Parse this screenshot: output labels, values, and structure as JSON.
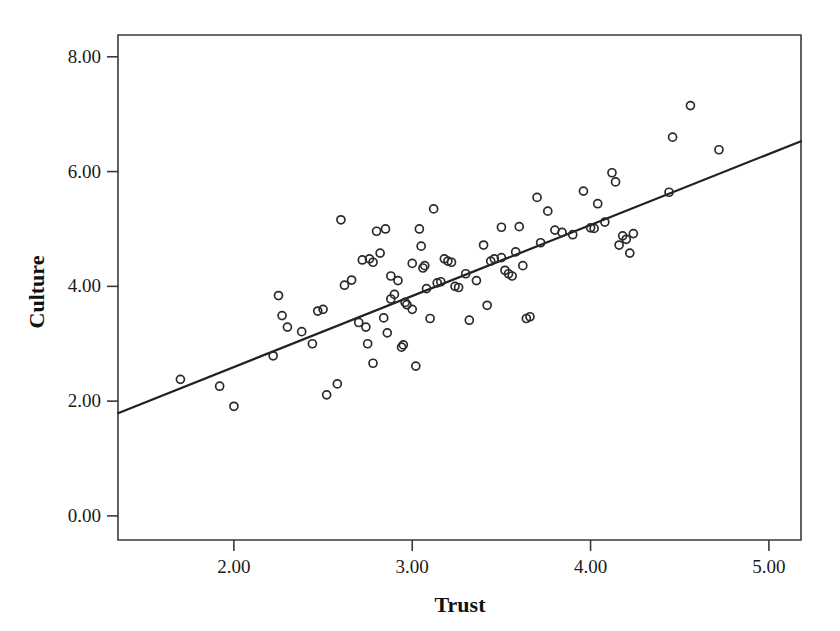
{
  "chart_data": {
    "type": "scatter",
    "title": "",
    "xlabel": "Trust",
    "ylabel": "Culture",
    "xlim": [
      1.35,
      5.18
    ],
    "ylim": [
      -0.42,
      8.38
    ],
    "xticks": [
      2.0,
      3.0,
      4.0,
      5.0
    ],
    "xtick_labels": [
      "2.00",
      "3.00",
      "4.00",
      "5.00"
    ],
    "yticks": [
      0.0,
      2.0,
      4.0,
      6.0,
      8.0
    ],
    "ytick_labels": [
      "0.00",
      "2.00",
      "4.00",
      "6.00",
      "8.00"
    ],
    "grid": false,
    "legend": null,
    "marker": "open-circle",
    "marker_color": "#2a2a2a",
    "fit_line": {
      "type": "linear-regression",
      "color": "#222222",
      "x_start": 1.35,
      "y_start": 1.79,
      "x_end": 5.18,
      "y_end": 6.53,
      "slope": 1.238,
      "intercept": 0.118
    },
    "points": [
      [
        1.7,
        2.38
      ],
      [
        1.92,
        2.26
      ],
      [
        2.0,
        1.91
      ],
      [
        2.22,
        2.79
      ],
      [
        2.25,
        3.84
      ],
      [
        2.27,
        3.49
      ],
      [
        2.3,
        3.29
      ],
      [
        2.38,
        3.21
      ],
      [
        2.44,
        3.0
      ],
      [
        2.47,
        3.57
      ],
      [
        2.5,
        3.6
      ],
      [
        2.52,
        2.11
      ],
      [
        2.58,
        2.3
      ],
      [
        2.6,
        5.16
      ],
      [
        2.62,
        4.02
      ],
      [
        2.66,
        4.11
      ],
      [
        2.7,
        3.37
      ],
      [
        2.72,
        4.46
      ],
      [
        2.74,
        3.29
      ],
      [
        2.75,
        3.0
      ],
      [
        2.76,
        4.48
      ],
      [
        2.78,
        4.42
      ],
      [
        2.78,
        2.66
      ],
      [
        2.8,
        4.96
      ],
      [
        2.82,
        4.58
      ],
      [
        2.84,
        3.45
      ],
      [
        2.85,
        5.0
      ],
      [
        2.86,
        3.19
      ],
      [
        2.88,
        4.18
      ],
      [
        2.88,
        3.78
      ],
      [
        2.9,
        3.86
      ],
      [
        2.92,
        4.1
      ],
      [
        2.94,
        2.94
      ],
      [
        2.95,
        2.98
      ],
      [
        2.96,
        3.72
      ],
      [
        2.97,
        3.68
      ],
      [
        3.0,
        4.4
      ],
      [
        3.0,
        3.6
      ],
      [
        3.02,
        2.61
      ],
      [
        3.04,
        5.0
      ],
      [
        3.05,
        4.7
      ],
      [
        3.06,
        4.32
      ],
      [
        3.07,
        4.36
      ],
      [
        3.08,
        3.96
      ],
      [
        3.1,
        3.44
      ],
      [
        3.12,
        5.35
      ],
      [
        3.14,
        4.06
      ],
      [
        3.16,
        4.08
      ],
      [
        3.18,
        4.48
      ],
      [
        3.2,
        4.44
      ],
      [
        3.22,
        4.42
      ],
      [
        3.24,
        4.0
      ],
      [
        3.26,
        3.98
      ],
      [
        3.3,
        4.22
      ],
      [
        3.32,
        3.41
      ],
      [
        3.36,
        4.1
      ],
      [
        3.4,
        4.72
      ],
      [
        3.42,
        3.67
      ],
      [
        3.44,
        4.44
      ],
      [
        3.46,
        4.48
      ],
      [
        3.5,
        5.03
      ],
      [
        3.5,
        4.5
      ],
      [
        3.52,
        4.28
      ],
      [
        3.54,
        4.22
      ],
      [
        3.56,
        4.18
      ],
      [
        3.58,
        4.6
      ],
      [
        3.6,
        5.04
      ],
      [
        3.62,
        4.36
      ],
      [
        3.64,
        3.44
      ],
      [
        3.66,
        3.47
      ],
      [
        3.7,
        5.55
      ],
      [
        3.72,
        4.76
      ],
      [
        3.76,
        5.31
      ],
      [
        3.8,
        4.98
      ],
      [
        3.84,
        4.94
      ],
      [
        3.9,
        4.9
      ],
      [
        3.96,
        5.66
      ],
      [
        4.0,
        5.02
      ],
      [
        4.02,
        5.01
      ],
      [
        4.04,
        5.44
      ],
      [
        4.08,
        5.12
      ],
      [
        4.12,
        5.98
      ],
      [
        4.14,
        5.82
      ],
      [
        4.16,
        4.72
      ],
      [
        4.18,
        4.88
      ],
      [
        4.2,
        4.82
      ],
      [
        4.22,
        4.58
      ],
      [
        4.24,
        4.92
      ],
      [
        4.44,
        5.64
      ],
      [
        4.46,
        6.6
      ],
      [
        4.56,
        7.15
      ],
      [
        4.72,
        6.38
      ]
    ]
  },
  "axes": {
    "y_title": "Culture",
    "x_title": "Trust"
  }
}
